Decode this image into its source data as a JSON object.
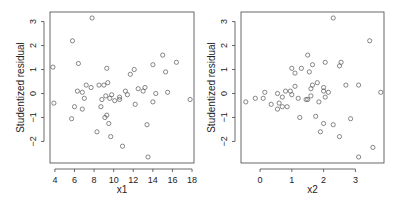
{
  "chart_data": [
    {
      "type": "scatter",
      "title": "",
      "xlabel": "x1",
      "ylabel": "Studentized residual",
      "xlim": [
        3.5,
        18.2
      ],
      "ylim": [
        -2.9,
        3.4
      ],
      "xticks": [
        4,
        6,
        8,
        10,
        12,
        14,
        16,
        18
      ],
      "yticks": [
        -2,
        -1,
        0,
        1,
        2,
        3
      ],
      "grid": false,
      "legend": null,
      "points": [
        [
          3.8,
          1.1
        ],
        [
          3.9,
          -0.4
        ],
        [
          5.7,
          -1.05
        ],
        [
          5.8,
          2.2
        ],
        [
          6.0,
          -0.55
        ],
        [
          6.3,
          0.1
        ],
        [
          6.4,
          1.25
        ],
        [
          6.8,
          0.05
        ],
        [
          6.8,
          -0.65
        ],
        [
          7.0,
          -0.2
        ],
        [
          7.2,
          0.35
        ],
        [
          7.7,
          0.25
        ],
        [
          7.8,
          3.15
        ],
        [
          8.3,
          -1.6
        ],
        [
          8.5,
          0.35
        ],
        [
          8.7,
          -0.55
        ],
        [
          8.8,
          -0.25
        ],
        [
          9.0,
          0.35
        ],
        [
          9.1,
          -1.0
        ],
        [
          9.2,
          -0.1
        ],
        [
          9.3,
          -0.9
        ],
        [
          9.3,
          1.05
        ],
        [
          9.4,
          0.45
        ],
        [
          9.5,
          -1.25
        ],
        [
          9.6,
          -0.2
        ],
        [
          9.7,
          -1.8
        ],
        [
          9.8,
          -0.05
        ],
        [
          10.1,
          -0.3
        ],
        [
          10.6,
          -0.15
        ],
        [
          10.6,
          -0.25
        ],
        [
          10.9,
          -2.2
        ],
        [
          11.2,
          0.1
        ],
        [
          11.4,
          -0.05
        ],
        [
          11.7,
          0.8
        ],
        [
          12.1,
          1.0
        ],
        [
          12.2,
          -0.45
        ],
        [
          12.5,
          0.2
        ],
        [
          13.0,
          0.1
        ],
        [
          13.2,
          0.25
        ],
        [
          13.4,
          -1.3
        ],
        [
          13.5,
          -2.65
        ],
        [
          14.0,
          1.2
        ],
        [
          14.0,
          -0.35
        ],
        [
          14.3,
          0.0
        ],
        [
          15.0,
          1.6
        ],
        [
          15.3,
          0.9
        ],
        [
          15.5,
          0.05
        ],
        [
          16.4,
          1.3
        ],
        [
          17.8,
          -0.25
        ]
      ]
    },
    {
      "type": "scatter",
      "title": "",
      "xlabel": "x2",
      "ylabel": "Studentized residual",
      "xlim": [
        -0.6,
        3.9
      ],
      "ylim": [
        -2.9,
        3.4
      ],
      "xticks": [
        0,
        1,
        2,
        3
      ],
      "yticks": [
        -2,
        -1,
        0,
        1,
        2,
        3
      ],
      "grid": false,
      "legend": null,
      "points": [
        [
          -0.45,
          -0.35
        ],
        [
          -0.15,
          -0.2
        ],
        [
          0.1,
          -0.2
        ],
        [
          0.15,
          0.05
        ],
        [
          0.35,
          -0.45
        ],
        [
          0.55,
          0.0
        ],
        [
          0.55,
          -0.65
        ],
        [
          0.6,
          -0.4
        ],
        [
          0.7,
          -0.55
        ],
        [
          0.7,
          -0.15
        ],
        [
          0.8,
          0.1
        ],
        [
          0.85,
          -0.55
        ],
        [
          0.95,
          0.1
        ],
        [
          1.0,
          -0.05
        ],
        [
          1.0,
          1.05
        ],
        [
          1.1,
          0.3
        ],
        [
          1.1,
          0.85
        ],
        [
          1.2,
          -0.2
        ],
        [
          1.25,
          -1.0
        ],
        [
          1.3,
          1.05
        ],
        [
          1.45,
          -0.25
        ],
        [
          1.5,
          -0.25
        ],
        [
          1.5,
          1.6
        ],
        [
          1.55,
          0.9
        ],
        [
          1.6,
          0.2
        ],
        [
          1.6,
          -0.1
        ],
        [
          1.65,
          0.35
        ],
        [
          1.65,
          1.2
        ],
        [
          1.75,
          -0.95
        ],
        [
          1.8,
          0.45
        ],
        [
          1.85,
          -0.35
        ],
        [
          1.9,
          -1.6
        ],
        [
          2.0,
          -1.25
        ],
        [
          2.0,
          0.25
        ],
        [
          2.0,
          0.1
        ],
        [
          2.05,
          1.3
        ],
        [
          2.05,
          -0.15
        ],
        [
          2.15,
          0.05
        ],
        [
          2.3,
          3.15
        ],
        [
          2.3,
          -1.3
        ],
        [
          2.5,
          1.15
        ],
        [
          2.5,
          -1.8
        ],
        [
          2.55,
          1.3
        ],
        [
          2.7,
          0.35
        ],
        [
          2.85,
          -1.05
        ],
        [
          3.1,
          0.35
        ],
        [
          3.1,
          -2.65
        ],
        [
          3.45,
          2.2
        ],
        [
          3.55,
          -2.25
        ],
        [
          3.8,
          0.05
        ]
      ]
    }
  ],
  "figure": {
    "panels": [
      {
        "xlabel": "x1",
        "ylabel": "Studentized residual"
      },
      {
        "xlabel": "x2",
        "ylabel": "Studentized residual"
      }
    ],
    "colors": {
      "axis": "#444444",
      "point": "#555555",
      "background": "#ffffff"
    }
  }
}
